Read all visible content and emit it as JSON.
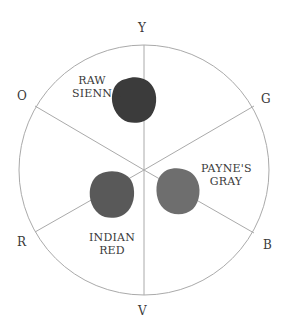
{
  "diagram": {
    "type": "color-wheel",
    "segments": 6,
    "hue_labels": {
      "top": "Y",
      "upper_right": "G",
      "lower_right": "B",
      "bottom": "V",
      "lower_left": "R",
      "upper_left": "O"
    },
    "paint_samples": [
      {
        "line1": "RAW",
        "line2": "SIENNA",
        "color": "#3b3b3b"
      },
      {
        "line1": "PAYNE'S",
        "line2": "GRAY",
        "color": "#6e6e6e"
      },
      {
        "line1": "INDIAN",
        "line2": "RED",
        "color": "#595959"
      }
    ],
    "colors": {
      "circle_stroke": "#aaaaaa",
      "spoke_stroke": "#aaaaaa",
      "background": "#ffffff"
    }
  }
}
